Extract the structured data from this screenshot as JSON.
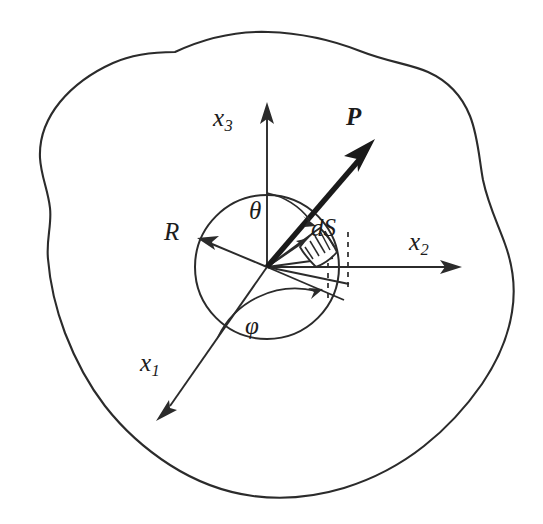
{
  "figure": {
    "background_color": "#ffffff",
    "ink_color": "#2b2b2b",
    "width": 543,
    "height": 524
  },
  "labels": {
    "x3": {
      "base": "x",
      "sub": "3",
      "text": "x3"
    },
    "x2": {
      "base": "x",
      "sub": "2",
      "text": "x2"
    },
    "x1": {
      "base": "x",
      "sub": "1",
      "text": "x1"
    },
    "radius": {
      "text": "R"
    },
    "theta": {
      "text": "θ"
    },
    "phi": {
      "text": "φ"
    },
    "surface_element": {
      "text": "dS"
    },
    "vector_p": {
      "text": "P"
    }
  },
  "geometry": {
    "origin": {
      "x": 267,
      "y": 267
    },
    "sphere_radius": 72,
    "axes": [
      {
        "name": "x3",
        "tip_x": 267,
        "tip_y": 105,
        "direction": "up"
      },
      {
        "name": "x2",
        "tip_x": 460,
        "tip_y": 267,
        "direction": "right"
      },
      {
        "name": "x1",
        "tip_x": 157,
        "tip_y": 419,
        "direction": "down-left"
      }
    ],
    "radius_vector": {
      "tip_x": 199,
      "tip_y": 239
    },
    "p_vector": {
      "tip_x": 372,
      "tip_y": 140
    },
    "theta_arc": {
      "from": "x3-axis",
      "to": "p-vector"
    },
    "phi_arc": {
      "from": "x1-axis",
      "to": "azimuth-ray"
    },
    "dashed_projections": 2
  },
  "icons": {
    "arrowhead": "arrowhead-icon",
    "hatched_patch": "hatched-surface-patch-icon"
  }
}
